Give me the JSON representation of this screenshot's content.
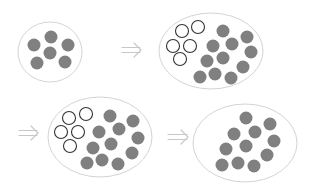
{
  "colors": {
    "background": "#ffffff",
    "ellipse_stroke": "#d4d4d4",
    "filled_dot": "#808080",
    "open_dot_stroke": "#333333",
    "arrow": "#c8c8c8"
  },
  "dot_radius": 6.5,
  "panels": [
    {
      "name": "stage-1",
      "ellipse": {
        "cx": 50,
        "cy": 52,
        "rx": 32,
        "ry": 30
      },
      "open": [],
      "filled": [
        [
          34,
          45
        ],
        [
          51,
          37
        ],
        [
          68,
          45
        ],
        [
          50,
          53
        ],
        [
          37,
          63
        ],
        [
          65,
          62
        ]
      ]
    },
    {
      "name": "stage-2",
      "ellipse": {
        "cx": 211,
        "cy": 51,
        "rx": 52,
        "ry": 38
      },
      "open": [
        [
          182,
          31
        ],
        [
          198,
          27
        ],
        [
          173,
          46
        ],
        [
          190,
          46
        ],
        [
          180,
          59
        ]
      ],
      "filled": [
        [
          223,
          31
        ],
        [
          247,
          37
        ],
        [
          213,
          46
        ],
        [
          232,
          44
        ],
        [
          251,
          52
        ],
        [
          207,
          61
        ],
        [
          223,
          58
        ],
        [
          243,
          67
        ],
        [
          200,
          77
        ],
        [
          215,
          74
        ],
        [
          231,
          78
        ]
      ]
    },
    {
      "name": "stage-3",
      "ellipse": {
        "cx": 100,
        "cy": 137,
        "rx": 52,
        "ry": 40
      },
      "open": [
        [
          69,
          118
        ],
        [
          86,
          114
        ],
        [
          61,
          132
        ],
        [
          78,
          132
        ],
        [
          70,
          146
        ]
      ],
      "filled": [
        [
          110,
          116
        ],
        [
          133,
          121
        ],
        [
          99,
          132
        ],
        [
          119,
          129
        ],
        [
          138,
          138
        ],
        [
          93,
          148
        ],
        [
          111,
          144
        ],
        [
          132,
          153
        ],
        [
          87,
          163
        ],
        [
          102,
          160
        ],
        [
          118,
          164
        ]
      ]
    },
    {
      "name": "stage-4",
      "ellipse": {
        "cx": 245,
        "cy": 143,
        "rx": 52,
        "ry": 39
      },
      "open": [],
      "filled": [
        [
          246,
          118
        ],
        [
          270,
          124
        ],
        [
          234,
          134
        ],
        [
          255,
          132
        ],
        [
          274,
          141
        ],
        [
          226,
          149
        ],
        [
          246,
          146
        ],
        [
          267,
          155
        ],
        [
          222,
          165
        ],
        [
          238,
          163
        ],
        [
          254,
          166
        ]
      ]
    }
  ],
  "arrows": [
    {
      "name": "arrow-1-to-2",
      "x1": 122,
      "x2": 141,
      "y": 50
    },
    {
      "name": "arrow-2-to-3",
      "x1": 19,
      "x2": 38,
      "y": 133
    },
    {
      "name": "arrow-3-to-4",
      "x1": 168,
      "x2": 188,
      "y": 137
    }
  ]
}
